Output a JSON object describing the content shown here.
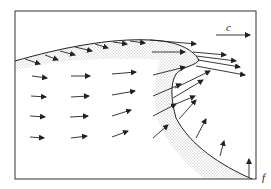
{
  "diagram": {
    "type": "flow-field-schematic",
    "labels": {
      "velocity": "c",
      "front": "f"
    },
    "colors": {
      "ink": "#222222",
      "background": "#ffffff",
      "stipple": "#555555"
    },
    "frame": {
      "x": 15,
      "y": 11,
      "width": 241,
      "height": 168
    }
  }
}
